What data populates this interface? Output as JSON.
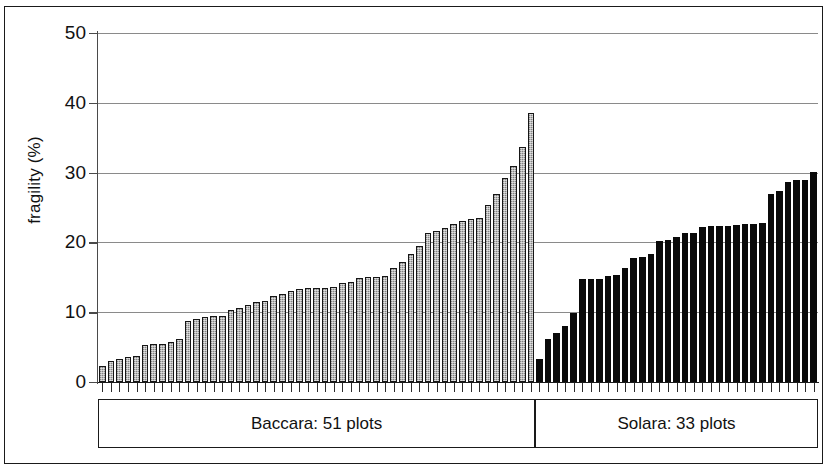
{
  "chart_data": {
    "type": "bar",
    "title": "",
    "subtitle": "",
    "xlabel": "",
    "ylabel": "fragility (%)",
    "ylim": [
      0,
      50
    ],
    "yticks": [
      0,
      10,
      20,
      30,
      40,
      50
    ],
    "grid": true,
    "legend": "none",
    "x_axis_note": "individual plots, sorted ascending within each cultivar group",
    "groups": [
      {
        "name": "Baccara",
        "label": "Baccara: 51 plots",
        "count": 51,
        "color": "#b9b9b9",
        "style": "light-gray hatched with dark outline",
        "values": [
          2.3,
          3.0,
          3.3,
          3.6,
          3.7,
          5.3,
          5.4,
          5.5,
          5.8,
          6.1,
          8.7,
          9.0,
          9.3,
          9.4,
          9.5,
          10.3,
          10.6,
          11.0,
          11.4,
          11.6,
          12.3,
          12.6,
          13.1,
          13.3,
          13.4,
          13.5,
          13.5,
          13.6,
          14.2,
          14.3,
          14.9,
          15.0,
          15.1,
          15.2,
          16.3,
          17.2,
          18.3,
          19.5,
          21.3,
          21.6,
          22.0,
          22.6,
          23.0,
          23.4,
          23.5,
          25.3,
          27.0,
          29.2,
          31.0,
          33.6,
          38.5
        ]
      },
      {
        "name": "Solara",
        "label": "Solara: 33 plots",
        "count": 33,
        "color": "#0a0a0a",
        "style": "solid black",
        "values": [
          3.3,
          6.2,
          7.0,
          8.0,
          9.9,
          14.7,
          14.7,
          14.8,
          15.2,
          15.4,
          16.4,
          17.8,
          17.9,
          18.4,
          20.2,
          20.4,
          20.8,
          21.3,
          21.4,
          22.2,
          22.3,
          22.4,
          22.4,
          22.5,
          22.6,
          22.7,
          22.8,
          26.9,
          27.4,
          28.6,
          28.9,
          29.0,
          30.1
        ]
      }
    ]
  },
  "axis": {
    "ytick_labels": [
      "50",
      "40",
      "30",
      "20",
      "10",
      "0"
    ],
    "ylabel": "fragility (%)"
  },
  "group_labels": {
    "baccara": "Baccara: 51 plots",
    "solara": "Solara: 33 plots"
  }
}
